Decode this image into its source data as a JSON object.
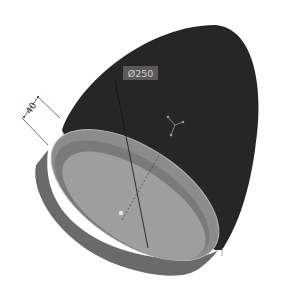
{
  "viewport": {
    "background": "#ffffff",
    "model": {
      "name": "dome-shell",
      "body_color": "#2b2b2b",
      "rim_color": "#8a8a8a",
      "inner_floor_color": "#9c9c9c",
      "skirt_color": "#6e6e6e"
    },
    "annotations": {
      "diameter_label": "Ø250",
      "height_label": "40"
    },
    "markers": {
      "axis_triad": "axis-triad-icon",
      "center_point": "center-point-marker"
    }
  }
}
